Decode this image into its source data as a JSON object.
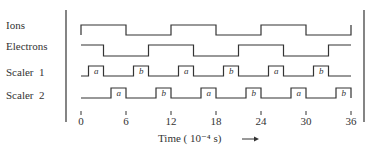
{
  "chart_data": {
    "type": "timing-diagram",
    "title": "",
    "xlabel": "Time (10⁻⁴ s)",
    "xlabel_arrow": "→",
    "x_ticks": [
      0,
      6,
      12,
      18,
      24,
      30,
      36
    ],
    "xlim": [
      0,
      36
    ],
    "series": [
      {
        "name": "Ions",
        "transitions": [
          [
            0,
            1
          ],
          [
            6,
            0
          ],
          [
            12,
            1
          ],
          [
            18,
            0
          ],
          [
            24,
            1
          ],
          [
            30,
            0
          ],
          [
            36,
            1
          ]
        ]
      },
      {
        "name": "Electrons",
        "transitions": [
          [
            0,
            1
          ],
          [
            3,
            0
          ],
          [
            9,
            1
          ],
          [
            15,
            0
          ],
          [
            21,
            1
          ],
          [
            27,
            0
          ],
          [
            33,
            1
          ]
        ]
      },
      {
        "name": "Scaler 1",
        "pulses": [
          {
            "start": 1,
            "end": 3,
            "label": "a"
          },
          {
            "start": 7,
            "end": 9,
            "label": "b"
          },
          {
            "start": 13,
            "end": 15,
            "label": "a"
          },
          {
            "start": 19,
            "end": 21,
            "label": "b"
          },
          {
            "start": 25,
            "end": 27,
            "label": "a"
          },
          {
            "start": 31,
            "end": 33,
            "label": "b"
          }
        ]
      },
      {
        "name": "Scaler 2",
        "pulses": [
          {
            "start": 4,
            "end": 6,
            "label": "a"
          },
          {
            "start": 10,
            "end": 12,
            "label": "b"
          },
          {
            "start": 16,
            "end": 18,
            "label": "a"
          },
          {
            "start": 22,
            "end": 24,
            "label": "b"
          },
          {
            "start": 28,
            "end": 30,
            "label": "a"
          },
          {
            "start": 34,
            "end": 36,
            "label": "b"
          }
        ]
      }
    ]
  },
  "labels": {
    "ions": "Ions",
    "electrons": "Electrons",
    "scaler1": "Scaler  1",
    "scaler2": "Scaler  2",
    "time": "Time ( 10⁻⁴ s)",
    "ticks": [
      "0",
      "6",
      "12",
      "18",
      "24",
      "30",
      "36"
    ]
  }
}
